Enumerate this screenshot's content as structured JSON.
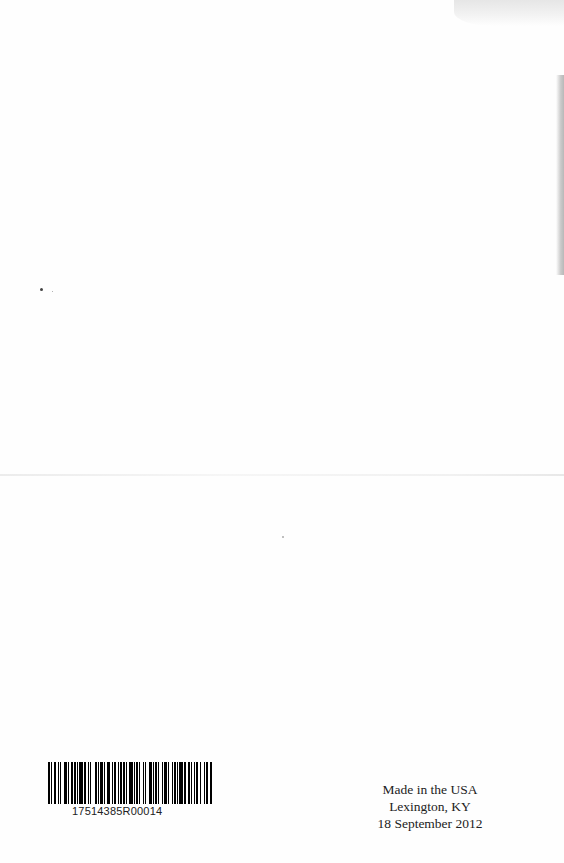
{
  "page": {
    "background": "#fefefe",
    "text_color": "#222222"
  },
  "barcode": {
    "number": "17514385R00014",
    "pattern": [
      2,
      1,
      1,
      1,
      2,
      2,
      1,
      1,
      1,
      2,
      3,
      1,
      1,
      2,
      1,
      1,
      2,
      1,
      1,
      1,
      3,
      1,
      2,
      2,
      1,
      1,
      1,
      3,
      2,
      1,
      1,
      1,
      2,
      1,
      1,
      2,
      3,
      1,
      1,
      1,
      2,
      2,
      1,
      1,
      1,
      1,
      2,
      1,
      1,
      2,
      3,
      1,
      1,
      1,
      2,
      1,
      1,
      2,
      1,
      1,
      1,
      3,
      2,
      1,
      1,
      1,
      2,
      1,
      1,
      2,
      1,
      1,
      3,
      1,
      1,
      2,
      1,
      1,
      2,
      1,
      1,
      1,
      3,
      1,
      2,
      2,
      1,
      1,
      1,
      2,
      1,
      1,
      2,
      1,
      1,
      3,
      1,
      1,
      2,
      1,
      2,
      1
    ]
  },
  "imprint": {
    "line1": "Made in the USA",
    "line2": "Lexington, KY",
    "line3": "18 September 2012"
  }
}
